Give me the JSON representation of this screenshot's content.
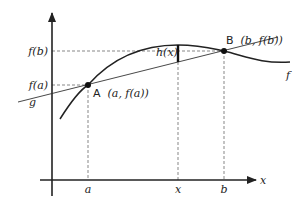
{
  "diagram": {
    "axes": {
      "x_label": "x",
      "y_label": ""
    },
    "y_ticks": {
      "fb": "f(b)",
      "fa": "f(a)"
    },
    "x_ticks": {
      "a": "a",
      "x": "x",
      "b": "b"
    },
    "points": {
      "A": {
        "name": "A",
        "coords": "(a, f(a))"
      },
      "B": {
        "name": "B",
        "coords": "(b, f(b))"
      }
    },
    "curves": {
      "f_label": "f",
      "g_label": "g",
      "h_label": "h(x)"
    },
    "colors": {
      "ink": "#222222",
      "dashed": "#555555",
      "background": "#ffffff"
    }
  }
}
